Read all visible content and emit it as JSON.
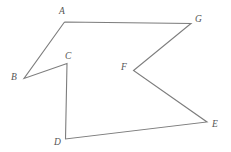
{
  "figure": {
    "canvas": {
      "width": 231,
      "height": 152,
      "background": "#ffffff"
    },
    "stroke": {
      "color": "#7d7d7d",
      "width": 1.1
    },
    "label_color": "#555555",
    "vertices": [
      {
        "id": "A",
        "label": "A",
        "x": 64.5,
        "y": 22.0,
        "label_x": 59.0,
        "label_y": 6.0
      },
      {
        "id": "B",
        "label": "B",
        "x": 24.0,
        "y": 78.5,
        "label_x": 11.0,
        "label_y": 72.0
      },
      {
        "id": "C",
        "label": "C",
        "x": 67.0,
        "y": 63.5,
        "label_x": 65.0,
        "label_y": 50.5
      },
      {
        "id": "D",
        "label": "D",
        "x": 65.5,
        "y": 139.0,
        "label_x": 54.0,
        "label_y": 136.5
      },
      {
        "id": "E",
        "label": "E",
        "x": 207.0,
        "y": 122.0,
        "label_x": 212.0,
        "label_y": 119.0
      },
      {
        "id": "F",
        "label": "F",
        "x": 133.5,
        "y": 70.5,
        "label_x": 121.0,
        "label_y": 61.5
      },
      {
        "id": "G",
        "label": "G",
        "x": 191.0,
        "y": 23.5,
        "label_x": 195.0,
        "label_y": 14.0
      }
    ],
    "path_order": [
      "A",
      "G",
      "F",
      "E",
      "D",
      "C",
      "B",
      "A"
    ],
    "edges": [
      {
        "from": "A",
        "to": "G"
      },
      {
        "from": "G",
        "to": "F"
      },
      {
        "from": "F",
        "to": "E"
      },
      {
        "from": "E",
        "to": "D"
      },
      {
        "from": "D",
        "to": "C"
      },
      {
        "from": "C",
        "to": "B"
      },
      {
        "from": "B",
        "to": "A"
      }
    ]
  }
}
